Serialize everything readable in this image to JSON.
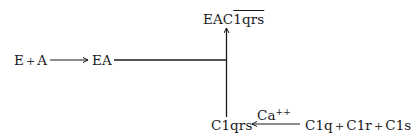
{
  "diagram": {
    "reactants": {
      "e": "E",
      "plus": "+",
      "a": "A"
    },
    "ea": "EA",
    "product": {
      "prefix": "EAC",
      "overlined": "1qrs"
    },
    "c1qrs": "C1qrs",
    "catalyst": {
      "base": "Ca",
      "charge": "++"
    },
    "subunits": {
      "c1q": "C1q",
      "plus1": "+",
      "c1r": "C1r",
      "plus2": "+",
      "c1s": "C1s"
    },
    "arrows": [
      {
        "from": "E + A",
        "to": "EA",
        "direction": "right"
      },
      {
        "from": "EA + C1qrs",
        "to": "EAC1qrs",
        "direction": "up"
      },
      {
        "from": "C1q + C1r + C1s",
        "to": "C1qrs",
        "direction": "left",
        "label": "Ca++"
      }
    ]
  }
}
